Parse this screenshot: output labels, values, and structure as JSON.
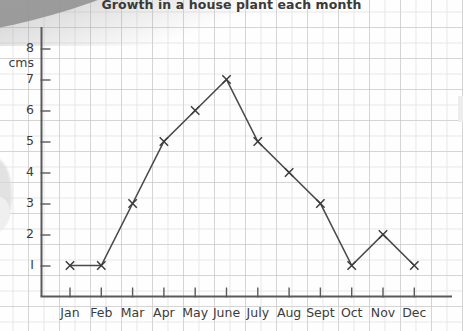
{
  "chart_data": {
    "type": "line",
    "title": "Growth in a house plant each month",
    "xlabel": "",
    "ylabel": "cms",
    "categories": [
      "Jan",
      "Feb",
      "Mar",
      "Apr",
      "May",
      "June",
      "July",
      "Aug",
      "Sept",
      "Oct",
      "Nov",
      "Dec"
    ],
    "values": [
      1,
      1,
      3,
      5,
      6,
      7,
      5,
      4,
      3,
      1,
      2,
      1
    ],
    "yticks": [
      "1",
      "2",
      "3",
      "4",
      "5",
      "6",
      "7",
      "8"
    ],
    "ytick_values": [
      1,
      2,
      3,
      4,
      5,
      6,
      7,
      8
    ],
    "ylim": [
      0,
      8
    ],
    "grid": true,
    "legend": null,
    "marker": "x-cross",
    "line_color": "#4a4a4a",
    "axis_color": "#555555",
    "grid_color": "#e6e6e6",
    "background_color": "#fefefe"
  },
  "axis": {
    "y_unit_label": "cms",
    "y_top_label": "8"
  }
}
